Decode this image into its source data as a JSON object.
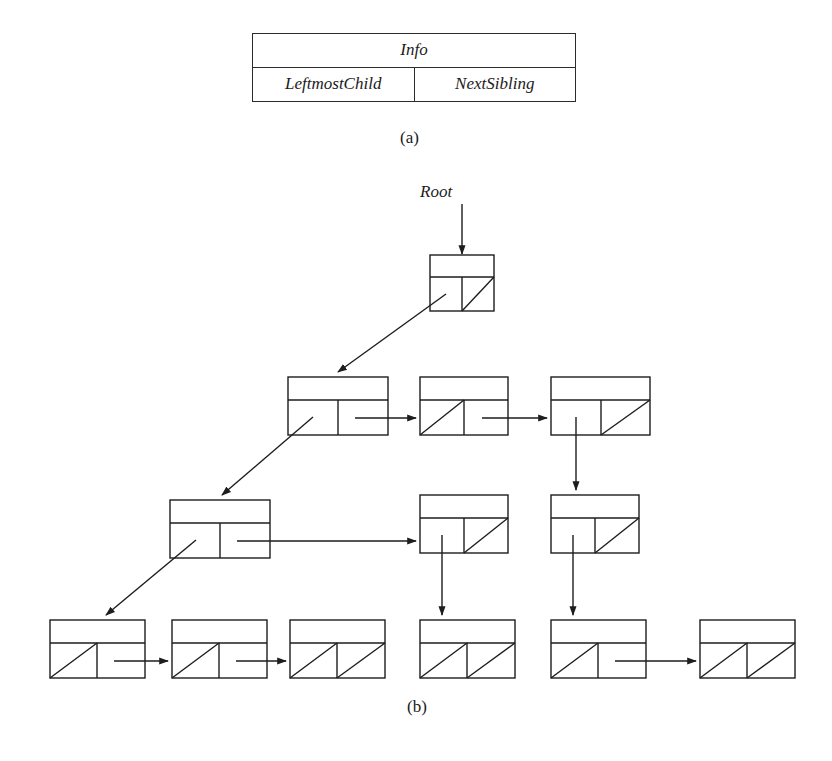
{
  "figure": {
    "part_a": {
      "caption": "(a)",
      "record_fields": {
        "info_label": "Info",
        "leftmost_child_label": "LeftmostChild",
        "next_sibling_label": "NextSibling"
      }
    },
    "part_b": {
      "caption": "(b)",
      "root_pointer_label": "Root",
      "stroke_color": "#1d1d1d",
      "background_color": "#ffffff",
      "node_box": {
        "width": 64,
        "height": 56,
        "info_height": 22
      },
      "nodes": [
        {
          "id": "root",
          "x": 430,
          "y": 255,
          "w": 64,
          "h": 56,
          "leftmost_child": "link",
          "next_sibling": "null"
        },
        {
          "id": "n1",
          "x": 288,
          "y": 377,
          "w": 100,
          "h": 58,
          "leftmost_child": "link",
          "next_sibling": "link"
        },
        {
          "id": "n2",
          "x": 420,
          "y": 377,
          "w": 88,
          "h": 58,
          "leftmost_child": "null",
          "next_sibling": "link"
        },
        {
          "id": "n3",
          "x": 551,
          "y": 377,
          "w": 99,
          "h": 58,
          "leftmost_child": "link",
          "next_sibling": "null"
        },
        {
          "id": "n4",
          "x": 170,
          "y": 500,
          "w": 100,
          "h": 58,
          "leftmost_child": "link",
          "next_sibling": "link"
        },
        {
          "id": "n5",
          "x": 420,
          "y": 495,
          "w": 88,
          "h": 58,
          "leftmost_child": "link",
          "next_sibling": "null"
        },
        {
          "id": "n6",
          "x": 551,
          "y": 495,
          "w": 88,
          "h": 58,
          "leftmost_child": "link",
          "next_sibling": "null"
        },
        {
          "id": "n7",
          "x": 50,
          "y": 620,
          "w": 95,
          "h": 58,
          "leftmost_child": "null",
          "next_sibling": "link"
        },
        {
          "id": "n8",
          "x": 172,
          "y": 620,
          "w": 95,
          "h": 58,
          "leftmost_child": "null",
          "next_sibling": "link"
        },
        {
          "id": "n9",
          "x": 290,
          "y": 620,
          "w": 95,
          "h": 58,
          "leftmost_child": "null",
          "next_sibling": "null"
        },
        {
          "id": "n10",
          "x": 420,
          "y": 620,
          "w": 95,
          "h": 58,
          "leftmost_child": "null",
          "next_sibling": "null"
        },
        {
          "id": "n11",
          "x": 551,
          "y": 620,
          "w": 95,
          "h": 58,
          "leftmost_child": "null",
          "next_sibling": "link"
        },
        {
          "id": "n12",
          "x": 700,
          "y": 620,
          "w": 95,
          "h": 58,
          "leftmost_child": "null",
          "next_sibling": "null"
        }
      ],
      "edges": [
        {
          "from": "root-pointer",
          "to": "root",
          "kind": "vertical-down"
        },
        {
          "from": "root",
          "to": "n1",
          "kind": "diagonal-down-left"
        },
        {
          "from": "n1",
          "to": "n2",
          "kind": "horizontal-right"
        },
        {
          "from": "n2",
          "to": "n3",
          "kind": "horizontal-right"
        },
        {
          "from": "n1",
          "to": "n4",
          "kind": "diagonal-down-left"
        },
        {
          "from": "n3",
          "to": "n6",
          "kind": "vertical-down"
        },
        {
          "from": "n4",
          "to": "n5",
          "kind": "horizontal-right"
        },
        {
          "from": "n4",
          "to": "n7",
          "kind": "diagonal-down-left"
        },
        {
          "from": "n5",
          "to": "n10",
          "kind": "vertical-down"
        },
        {
          "from": "n6",
          "to": "n11",
          "kind": "vertical-down"
        },
        {
          "from": "n7",
          "to": "n8",
          "kind": "horizontal-right"
        },
        {
          "from": "n8",
          "to": "n9",
          "kind": "horizontal-right"
        },
        {
          "from": "n11",
          "to": "n12",
          "kind": "horizontal-right"
        }
      ]
    }
  }
}
